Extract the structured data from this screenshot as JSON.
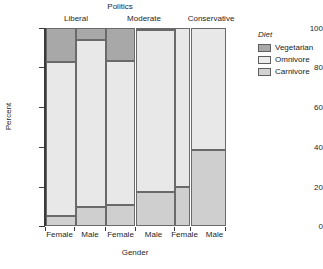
{
  "chart_data": {
    "type": "bar",
    "subtype": "stacked-mosaic",
    "title": "Politics",
    "xlabel": "Gender",
    "ylabel": "Percent",
    "ylim": [
      0,
      100
    ],
    "yticks": [
      "0",
      "20",
      "40",
      "60",
      "80",
      "100"
    ],
    "grid": false,
    "legend": {
      "title": "Diet",
      "position": "right",
      "entries": [
        {
          "label": "Vegetarian",
          "color": "#a8a8a8"
        },
        {
          "label": "Omnivore",
          "color": "#e8e8e8"
        },
        {
          "label": "Carnivore",
          "color": "#cfcfcf"
        }
      ]
    },
    "panels": [
      "Liberal",
      "Moderate",
      "Conservative"
    ],
    "categories": [
      "Female",
      "Male",
      "Female",
      "Male",
      "Female",
      "Male"
    ],
    "panel_of_category": [
      "Liberal",
      "Liberal",
      "Moderate",
      "Moderate",
      "Conservative",
      "Conservative"
    ],
    "bar_widths_percent": [
      16.5,
      17.0,
      16.5,
      22.0,
      8.5,
      19.5
    ],
    "series": [
      {
        "name": "Vegetarian",
        "values": [
          17.3,
          6.0,
          16.8,
          1.0,
          0.0,
          0.0
        ]
      },
      {
        "name": "Omnivore",
        "values": [
          77.7,
          84.5,
          72.7,
          82.0,
          80.5,
          61.5
        ]
      },
      {
        "name": "Carnivore",
        "values": [
          5.0,
          9.5,
          10.5,
          17.0,
          19.5,
          38.5
        ]
      }
    ],
    "bars": [
      {
        "panel": "Liberal",
        "gender": "Female",
        "vegetarian_top": 100,
        "omnivore_top": 82.7,
        "carnivore_top": 5.0
      },
      {
        "panel": "Liberal",
        "gender": "Male",
        "vegetarian_top": 100,
        "omnivore_top": 94.0,
        "carnivore_top": 9.5
      },
      {
        "panel": "Moderate",
        "gender": "Female",
        "vegetarian_top": 100,
        "omnivore_top": 83.2,
        "carnivore_top": 10.5
      },
      {
        "panel": "Moderate",
        "gender": "Male",
        "vegetarian_top": 100,
        "omnivore_top": 99.0,
        "carnivore_top": 17.0
      },
      {
        "panel": "Conservative",
        "gender": "Female",
        "vegetarian_top": 100,
        "omnivore_top": 100,
        "carnivore_top": 19.5
      },
      {
        "panel": "Conservative",
        "gender": "Male",
        "vegetarian_top": 100,
        "omnivore_top": 100,
        "carnivore_top": 38.5
      }
    ]
  },
  "axes": {
    "yticks": [
      {
        "label": "100",
        "value": 100
      },
      {
        "label": "80",
        "value": 80
      },
      {
        "label": "60",
        "value": 60
      },
      {
        "label": "40",
        "value": 40
      },
      {
        "label": "20",
        "value": 20
      },
      {
        "label": "0",
        "value": 0
      }
    ]
  }
}
